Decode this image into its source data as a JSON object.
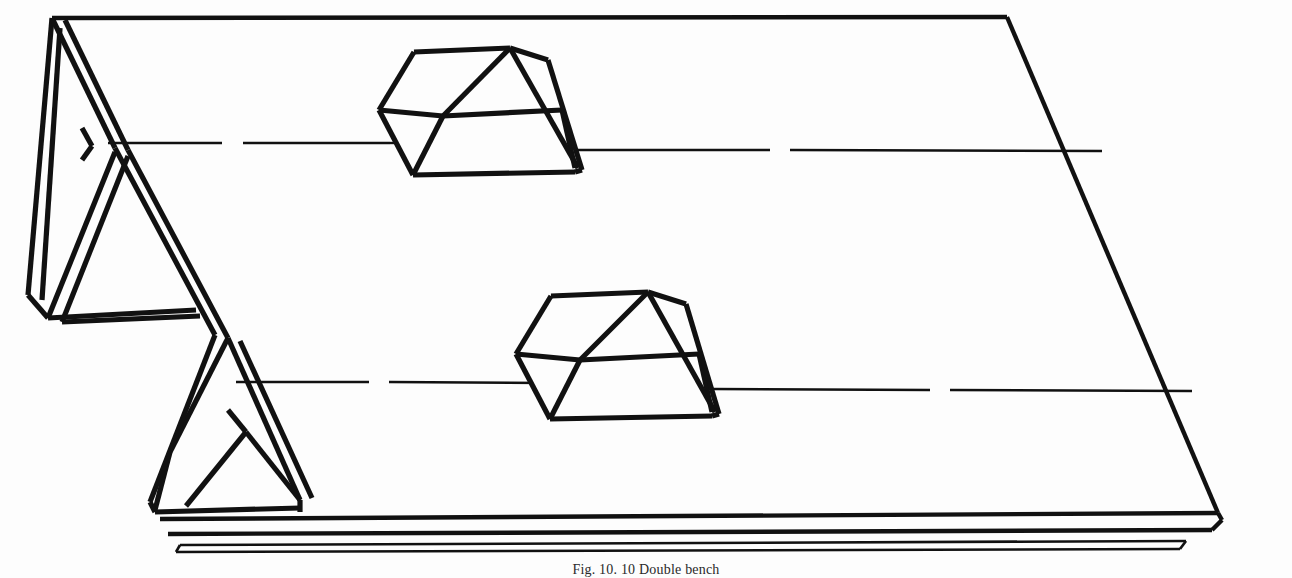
{
  "figure": {
    "caption": "Fig. 10. 10  Double bench",
    "background_color": "#fdfdfd",
    "line_color": "#111111",
    "drawing_type": "isometric-line-drawing"
  },
  "parts": {
    "worktop": {
      "label": "bench top surface",
      "description": "large flat parallelogram top of the bench"
    },
    "front_apron": {
      "label": "front apron rail",
      "description": "long double-line rail running along the lower front edge"
    },
    "leg_rear": {
      "label": "rear trestle leg",
      "description": "X-braced A-frame leg at the far left"
    },
    "leg_front": {
      "label": "front trestle leg",
      "description": "A-frame leg toward the lower left"
    },
    "centerline_upper": {
      "label": "upper centerline",
      "description": "dash-gap centerline running across the top surface"
    },
    "centerline_lower": {
      "label": "lower centerline",
      "description": "dash-gap centerline running across the lower surface band"
    },
    "block_upper": {
      "label": "upper block with wedge",
      "description": "cube seated on the worktop with a triangular wedge at its right"
    },
    "block_lower": {
      "label": "lower block with wedge",
      "description": "cube seated on the worktop with a triangular wedge at its right"
    }
  }
}
